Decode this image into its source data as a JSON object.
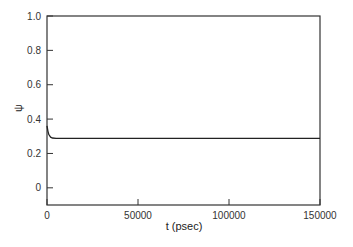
{
  "chart_data": {
    "type": "line",
    "title": "",
    "xlabel": "t (psec)",
    "ylabel": "ψ",
    "xlim": [
      0,
      150000
    ],
    "ylim": [
      -0.1,
      1.0
    ],
    "grid": false,
    "legend": null,
    "x_ticks": [
      "0",
      "50000",
      "100000",
      "150000"
    ],
    "y_ticks": [
      "0",
      "0.2",
      "0.4",
      "0.6",
      "0.8",
      "1.0"
    ],
    "series": [
      {
        "name": "psi",
        "x": [
          0,
          500,
          1000,
          2000,
          3000,
          5000,
          10000,
          50000,
          100000,
          150000
        ],
        "values": [
          0.36,
          0.33,
          0.31,
          0.295,
          0.29,
          0.288,
          0.288,
          0.288,
          0.288,
          0.288
        ]
      }
    ]
  }
}
